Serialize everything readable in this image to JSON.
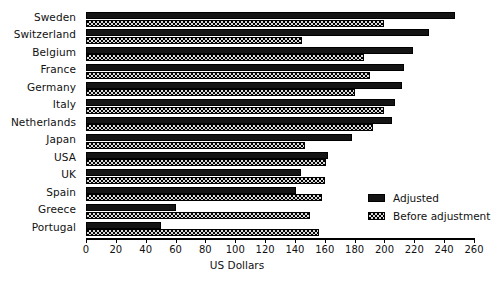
{
  "chart_data": {
    "type": "bar",
    "orientation": "horizontal",
    "title": "",
    "xlabel": "US Dollars",
    "ylabel": "",
    "xlim": [
      0,
      260
    ],
    "xticks": [
      0,
      20,
      40,
      60,
      80,
      100,
      120,
      140,
      160,
      180,
      200,
      220,
      240,
      260
    ],
    "grid": false,
    "legend_position": "inside-bottom-right",
    "categories": [
      "Sweden",
      "Switzerland",
      "Belgium",
      "France",
      "Germany",
      "Italy",
      "Netherlands",
      "Japan",
      "USA",
      "UK",
      "Spain",
      "Greece",
      "Portugal"
    ],
    "series": [
      {
        "name": "Adjusted",
        "color": "#141414",
        "pattern": "solid",
        "values": [
          247,
          230,
          219,
          213,
          212,
          207,
          205,
          178,
          162,
          144,
          141,
          60,
          50
        ]
      },
      {
        "name": "Before adjustment",
        "color": "#d8d8d8",
        "pattern": "dotted",
        "values": [
          200,
          145,
          186,
          190,
          180,
          200,
          192,
          147,
          161,
          160,
          158,
          150,
          156
        ]
      }
    ]
  },
  "legend": {
    "entries": [
      {
        "label": "Adjusted",
        "swatch": "solid-black-swatch"
      },
      {
        "label": "Before adjustment",
        "swatch": "dotted-swatch"
      }
    ]
  },
  "axis": {
    "x_title": "US Dollars"
  }
}
